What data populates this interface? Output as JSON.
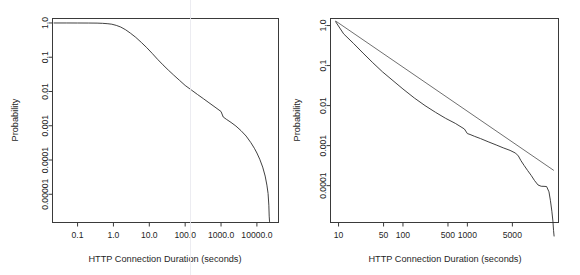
{
  "figure": {
    "background": "#ffffff",
    "ink_color": "#2b2b2b",
    "panel_count": 2
  },
  "chart_data": [
    {
      "id": "left-panel",
      "type": "line",
      "title": "",
      "xlabel": "HTTP Connection Duration (seconds)",
      "ylabel": "Probability",
      "xscale": "log",
      "yscale": "log",
      "grid": false,
      "legend": null,
      "xticks": [
        0.1,
        1.0,
        10.0,
        100.0,
        1000.0,
        10000.0
      ],
      "xtick_labels": [
        "0.1",
        "1.0",
        "10.0",
        "100.0",
        "1000.0",
        "10000.0"
      ],
      "yticks": [
        1.0,
        0.1,
        0.01,
        0.001,
        0.0001,
        1e-05
      ],
      "ytick_labels": [
        "1.0",
        "0.1",
        "0.01",
        "0.001",
        "0.0001",
        "0.00001"
      ],
      "xlim": [
        0.02,
        40000
      ],
      "ylim": [
        1.5e-06,
        1.35
      ],
      "series": [
        {
          "name": "Complementary CDF of HTTP connection duration",
          "x": [
            0.022,
            0.05,
            0.1,
            0.2,
            0.35,
            0.5,
            0.7,
            0.9,
            1.2,
            1.6,
            2.2,
            3.0,
            4.2,
            6.0,
            8.5,
            12,
            17,
            24,
            34,
            48,
            70,
            100,
            150,
            220,
            320,
            460,
            680,
            1000,
            1150,
            1400,
            1900,
            2600,
            3600,
            5000,
            6800,
            8500,
            10000,
            12000,
            14500,
            17000,
            19000,
            20500,
            21500,
            22000,
            22500
          ],
          "y": [
            1.0,
            1.0,
            0.998,
            0.995,
            0.99,
            0.975,
            0.95,
            0.92,
            0.85,
            0.76,
            0.63,
            0.5,
            0.38,
            0.27,
            0.19,
            0.13,
            0.087,
            0.06,
            0.042,
            0.03,
            0.021,
            0.015,
            0.011,
            0.0082,
            0.0062,
            0.0047,
            0.0035,
            0.0026,
            0.0018,
            0.00155,
            0.00125,
            0.00098,
            0.00072,
            0.0005,
            0.00032,
            0.00022,
            0.00016,
            0.000105,
            6.2e-05,
            3.4e-05,
            1.85e-05,
            1.05e-05,
            4.8e-06,
            2.3e-06,
            1.6e-06
          ]
        }
      ]
    },
    {
      "id": "right-panel",
      "type": "line",
      "title": "",
      "xlabel": "HTTP Connection Duration (seconds)",
      "ylabel": "Probability",
      "xscale": "log",
      "yscale": "log",
      "grid": false,
      "legend": null,
      "xticks": [
        10,
        50,
        100,
        500,
        1000,
        5000
      ],
      "xtick_labels": [
        "10",
        "50",
        "100",
        "500",
        "1000",
        "5000"
      ],
      "yticks": [
        1.0,
        0.1,
        0.01,
        0.001,
        0.0001
      ],
      "ytick_labels": [
        "1.0",
        "0.1",
        "0.01",
        "0.001",
        "0.0001"
      ],
      "xlim": [
        7.5,
        26000
      ],
      "ylim": [
        1.2e-05,
        1.5
      ],
      "series": [
        {
          "name": "Empirical tail distribution",
          "x": [
            9,
            12,
            17,
            24,
            34,
            48,
            70,
            100,
            150,
            220,
            320,
            460,
            650,
            900,
            1000,
            1100,
            1300,
            1600,
            2100,
            2800,
            3600,
            4600,
            5600,
            6200,
            6800,
            7600,
            8600,
            9800,
            11000,
            12500,
            14000,
            15500,
            17000,
            18500,
            19500,
            20500,
            21300,
            21800,
            22200
          ],
          "y": [
            1.25,
            0.62,
            0.36,
            0.205,
            0.118,
            0.07,
            0.042,
            0.026,
            0.0155,
            0.01,
            0.0068,
            0.0048,
            0.0036,
            0.0026,
            0.002,
            0.0019,
            0.0017,
            0.0015,
            0.00125,
            0.00104,
            0.00088,
            0.00076,
            0.00065,
            0.00055,
            0.00042,
            0.00032,
            0.00024,
            0.00018,
            0.000135,
            0.000104,
            9.65e-05,
            9.6e-05,
            9.5e-05,
            7e-05,
            4.2e-05,
            2.3e-05,
            1.3e-05,
            7.5e-06,
            5.5e-06
          ]
        },
        {
          "name": "Fitted Pareto power-law line",
          "x": [
            9,
            22000
          ],
          "y": [
            1.3,
            0.00024
          ]
        }
      ]
    }
  ]
}
